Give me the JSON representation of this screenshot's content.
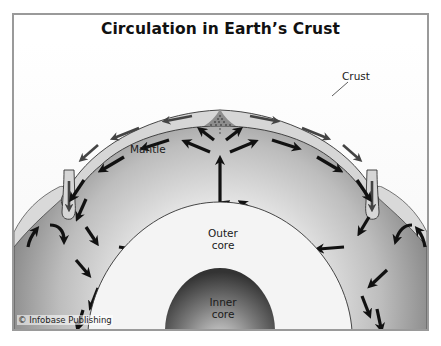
{
  "title": "Circulation in Earth’s Crust",
  "labels": {
    "crust": "Crust",
    "mantle": "Mantle",
    "outer_core_line1": "Outer",
    "outer_core_line2": "core",
    "inner_core_line1": "Inner",
    "inner_core_line2": "core"
  },
  "credit": "© Infobase Publishing",
  "colors": {
    "crust_fill": "#d6d6d6",
    "mantle_dark": "#777777",
    "mantle_light": "#ececec",
    "outer_core": "#f4f4f4",
    "inner_core_dark": "#3a3a3a",
    "inner_core_light": "#bdbdbd",
    "arrow": "#111111"
  }
}
